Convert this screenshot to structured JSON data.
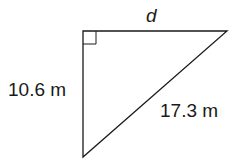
{
  "diagram": {
    "type": "right-triangle",
    "labels": {
      "top_side": "d",
      "left_side": "10.6 m",
      "hypotenuse": "17.3 m"
    },
    "right_angle_marker": true,
    "colors": {
      "stroke": "#1a1a1a",
      "background": "#ffffff"
    }
  }
}
